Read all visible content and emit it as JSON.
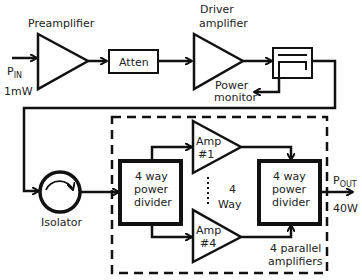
{
  "diagram": {
    "blocks": {
      "preamplifier": {
        "label": "Preamplifier"
      },
      "attenuator": {
        "label": "Atten"
      },
      "driver": {
        "label_line1": "Driver",
        "label_line2": "amplifier"
      },
      "coupler": {
        "label_line1": "Power",
        "label_line2": "monitor"
      },
      "isolator": {
        "label": "Isolator"
      },
      "divider_left": {
        "line1": "4 way",
        "line2": "power",
        "line3": "divider"
      },
      "divider_right": {
        "line1": "4 way",
        "line2": "power",
        "line3": "divider"
      },
      "amp1": {
        "line1": "Amp",
        "line2": "#1"
      },
      "amp4": {
        "line1": "Amp",
        "line2": "#4"
      },
      "way": {
        "line1": "4",
        "line2": "Way"
      },
      "parallel": {
        "line1": "4 parallel",
        "line2": "amplifiers"
      }
    },
    "input": {
      "symbol": "P",
      "subscript": "IN",
      "value": "1mW"
    },
    "output": {
      "symbol": "P",
      "subscript": "OUT",
      "value": "40W"
    },
    "colors": {
      "stroke": "#111111",
      "text": "#222222",
      "background": "#ffffff"
    }
  }
}
